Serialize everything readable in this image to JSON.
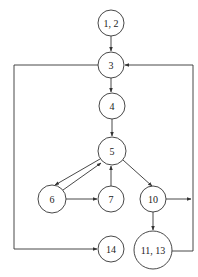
{
  "diagram": {
    "type": "control-flow-graph",
    "colors": {
      "stroke": "#333333",
      "background": "#ffffff",
      "text": "#222222"
    },
    "nodes": [
      {
        "id": "n12",
        "label": "1, 2",
        "cx": 111,
        "cy": 23,
        "r": 13
      },
      {
        "id": "n3",
        "label": "3",
        "cx": 111,
        "cy": 65,
        "r": 13
      },
      {
        "id": "n4",
        "label": "4",
        "cx": 112,
        "cy": 106,
        "r": 13
      },
      {
        "id": "n5",
        "label": "5",
        "cx": 112,
        "cy": 151,
        "r": 14
      },
      {
        "id": "n6",
        "label": "6",
        "cx": 52,
        "cy": 199,
        "r": 14
      },
      {
        "id": "n7",
        "label": "7",
        "cx": 111,
        "cy": 199,
        "r": 13
      },
      {
        "id": "n10",
        "label": "10",
        "cx": 153,
        "cy": 199,
        "r": 13
      },
      {
        "id": "n14",
        "label": "14",
        "cx": 111,
        "cy": 249,
        "r": 13
      },
      {
        "id": "n1113",
        "label": "11, 13",
        "cx": 153,
        "cy": 250,
        "r": 19
      }
    ],
    "edges": [
      {
        "from": "1, 2",
        "to": "3"
      },
      {
        "from": "3",
        "to": "4"
      },
      {
        "from": "4",
        "to": "5"
      },
      {
        "from": "5",
        "to": "6"
      },
      {
        "from": "6",
        "to": "5"
      },
      {
        "from": "6",
        "to": "7"
      },
      {
        "from": "7",
        "to": "5"
      },
      {
        "from": "5",
        "to": "10"
      },
      {
        "from": "10",
        "to": "11, 13"
      },
      {
        "from": "10",
        "to": "3"
      },
      {
        "from": "11, 13",
        "to": "3"
      },
      {
        "from": "3",
        "to": "14"
      }
    ]
  }
}
